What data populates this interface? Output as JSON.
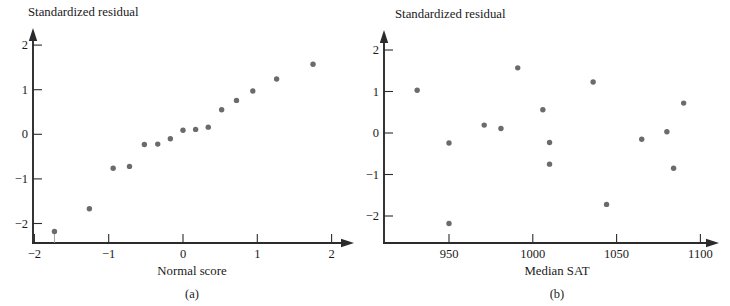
{
  "figure": {
    "background": "#ffffff",
    "point_color": "#6b6b6b",
    "axis_color": "#2b2b2b"
  },
  "panels": [
    {
      "key": "a",
      "caption": "(a)",
      "chart_data": {
        "type": "scatter",
        "title": "",
        "xlabel": "Normal score",
        "ylabel": "Standardized residual",
        "xlim": [
          -2.35,
          2.25
        ],
        "ylim": [
          -2.55,
          2.45
        ],
        "xticks": [
          -2,
          -1,
          0,
          1,
          2
        ],
        "xticklabels": [
          "−2",
          "−1",
          "0",
          "1",
          "2"
        ],
        "yticks": [
          -2,
          -1,
          0,
          1,
          2
        ],
        "yticklabels": [
          "−2",
          "−1",
          "0",
          "1",
          "2"
        ],
        "grid": false,
        "legend": "none",
        "x": [
          -1.73,
          -1.26,
          -0.94,
          -0.72,
          -0.52,
          -0.34,
          -0.17,
          0.0,
          0.17,
          0.34,
          0.52,
          0.72,
          0.94,
          1.26,
          1.75
        ],
        "y": [
          -2.18,
          -1.67,
          -0.76,
          -0.72,
          -0.23,
          -0.22,
          -0.1,
          0.09,
          0.11,
          0.16,
          0.55,
          0.76,
          0.97,
          1.24,
          1.57
        ]
      }
    },
    {
      "key": "b",
      "caption": "(b)",
      "chart_data": {
        "type": "scatter",
        "title": "",
        "xlabel": "Median SAT",
        "ylabel": "Standardized residual",
        "xlim": [
          920,
          1110
        ],
        "ylim": [
          -2.55,
          2.45
        ],
        "xticks": [
          950,
          1000,
          1050,
          1100
        ],
        "xticklabels": [
          "950",
          "1000",
          "1050",
          "1100"
        ],
        "yticks": [
          -2,
          -1,
          0,
          1,
          2
        ],
        "yticklabels": [
          "−2",
          "−1",
          "0",
          "1",
          "2"
        ],
        "grid": false,
        "legend": "none",
        "x": [
          931,
          950,
          950,
          971,
          981,
          991,
          1006,
          1010,
          1010,
          1036,
          1044,
          1065,
          1080,
          1084,
          1090
        ],
        "y": [
          1.03,
          -0.24,
          -2.18,
          0.19,
          0.11,
          1.57,
          0.56,
          -0.23,
          -0.75,
          1.23,
          -1.72,
          -0.15,
          0.03,
          -0.85,
          0.72
        ]
      }
    }
  ]
}
